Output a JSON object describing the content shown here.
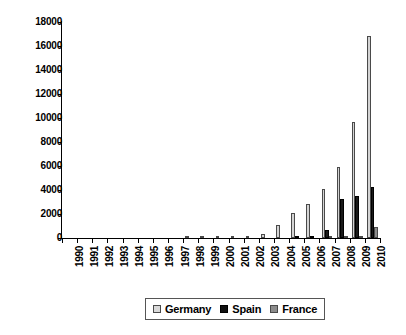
{
  "chart_data": {
    "type": "bar",
    "title": "",
    "subtitle": "",
    "xlabel": "",
    "ylabel": "",
    "ylim": [
      0,
      18000
    ],
    "ytick_step": 2000,
    "ytick_labels": [
      "0",
      "2000",
      "4000",
      "6000",
      "8000",
      "10000",
      "12000",
      "14000",
      "16000",
      "18000"
    ],
    "ytick_values": [
      0,
      2000,
      4000,
      6000,
      8000,
      10000,
      12000,
      14000,
      16000,
      18000
    ],
    "grid": false,
    "legend_position": "bottom-center",
    "categories": [
      "1990",
      "1991",
      "1992",
      "1993",
      "1994",
      "1995",
      "1996",
      "1997",
      "1998",
      "1999",
      "2000",
      "2001",
      "2002",
      "2003",
      "2004",
      "2005",
      "2006",
      "2007",
      "2008",
      "2009",
      "2010"
    ],
    "series": [
      {
        "name": "Germany",
        "color": "#d4d4d4",
        "values": [
          0,
          0,
          0,
          0,
          0,
          0,
          0,
          0,
          10,
          30,
          60,
          80,
          160,
          300,
          1100,
          2050,
          2800,
          4100,
          5900,
          9650,
          16800
        ]
      },
      {
        "name": "Spain",
        "color": "#1a1a1a",
        "values": [
          0,
          0,
          0,
          0,
          0,
          0,
          0,
          0,
          0,
          0,
          0,
          0,
          0,
          0,
          0,
          20,
          90,
          660,
          3250,
          3500,
          4250
        ]
      },
      {
        "name": "France",
        "color": "#8c8c8c",
        "values": [
          0,
          0,
          0,
          0,
          0,
          0,
          0,
          0,
          0,
          0,
          0,
          0,
          0,
          0,
          0,
          0,
          0,
          40,
          80,
          200,
          900
        ]
      }
    ]
  },
  "legend": {
    "items": [
      {
        "label": "Germany",
        "swatch": "germany"
      },
      {
        "label": "Spain",
        "swatch": "spain"
      },
      {
        "label": "France",
        "swatch": "france"
      }
    ]
  }
}
